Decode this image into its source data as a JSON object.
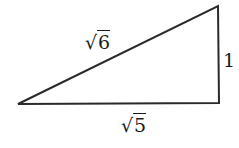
{
  "diagram": {
    "type": "right-triangle",
    "stroke_color": "#2a2a2a",
    "vertices": {
      "left": [
        18,
        104
      ],
      "bottom_right": [
        219,
        103
      ],
      "top_right": [
        218,
        6
      ]
    },
    "sides": {
      "hypotenuse": {
        "radical": "√",
        "radicand": "6"
      },
      "vertical": {
        "value": "1"
      },
      "base": {
        "radical": "√",
        "radicand": "5"
      }
    }
  }
}
